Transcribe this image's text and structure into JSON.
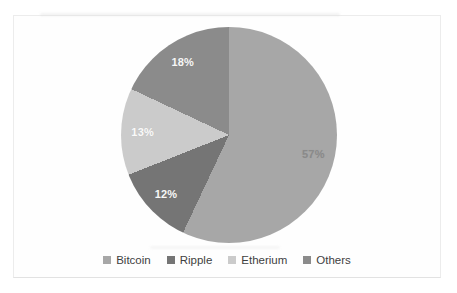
{
  "chart_data": {
    "type": "pie",
    "title": "",
    "start_angle_deg": 0,
    "direction": "clockwise",
    "legend_position": "bottom",
    "categories": [
      "Bitcoin",
      "Ripple",
      "Etherium",
      "Others"
    ],
    "values": [
      57,
      12,
      13,
      18
    ],
    "segments": [
      {
        "label": "Bitcoin",
        "value": 57,
        "display": "57%",
        "color": "#a7a7a7",
        "label_color": "#8a8a8a"
      },
      {
        "label": "Ripple",
        "value": 12,
        "display": "12%",
        "color": "#757575",
        "label_color": "#f7f7f7"
      },
      {
        "label": "Etherium",
        "value": 13,
        "display": "13%",
        "color": "#cbcbcb",
        "label_color": "#fafafa"
      },
      {
        "label": "Others",
        "value": 18,
        "display": "18%",
        "color": "#8b8b8b",
        "label_color": "#f7f7f7"
      }
    ]
  },
  "frame": {
    "border_color": "#ececec",
    "background": "#fefefe"
  }
}
